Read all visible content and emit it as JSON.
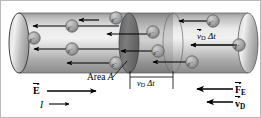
{
  "figure": {
    "type": "physics-diagram",
    "background": "#ffffff",
    "border_color": "#b9b9b9"
  },
  "labels": {
    "area": {
      "text": "Area ",
      "symbol": "A"
    },
    "slab_width": {
      "v": "v",
      "sub": "D",
      "dt": " Δt"
    },
    "drift_distance": {
      "v": "v",
      "sub": "D",
      "dt": " Δt"
    },
    "field": {
      "symbol": "E"
    },
    "current": {
      "symbol": "I"
    },
    "force": {
      "symbol": "F",
      "sub": "E"
    },
    "drift_velocity": {
      "symbol": "v",
      "sub": "D"
    },
    "electron": {
      "symbol": "e",
      "charge": "−"
    }
  },
  "colors": {
    "cylinder_light": "#e8e8e8",
    "cylinder_mid": "#b5b5b5",
    "cylinder_dark": "#8a8a8a",
    "disk_dark": "#6f6f6f",
    "slab_shade": "#9a9a9a",
    "outline": "#2a2a2a",
    "arrow": "#000000",
    "electron_fill": "#a8a8a8",
    "electron_stroke": "#555555",
    "text": "#000000"
  },
  "geometry": {
    "cylinder": {
      "left_x": 18,
      "right_x": 247,
      "top_y": 12,
      "bottom_y": 72,
      "cap_rx": 10
    },
    "disk_area_a": {
      "cx": 128,
      "rx": 10
    },
    "slab_right": {
      "cx": 172,
      "rx": 10
    }
  },
  "electrons": [
    {
      "cx": 71,
      "cy": 25
    },
    {
      "cx": 115,
      "cy": 17
    },
    {
      "cx": 71,
      "cy": 48
    },
    {
      "cx": 115,
      "cy": 62
    },
    {
      "cx": 33,
      "cy": 37
    },
    {
      "cx": 152,
      "cy": 31
    },
    {
      "cx": 157,
      "cy": 50
    },
    {
      "cx": 212,
      "cy": 20
    },
    {
      "cx": 238,
      "cy": 44
    },
    {
      "cx": 191,
      "cy": 61
    }
  ],
  "arrows": [
    {
      "from_x": 118,
      "to_x": 32,
      "y": 25
    },
    {
      "from_x": 98,
      "to_x": 78,
      "y": 19
    },
    {
      "from_x": 118,
      "to_x": 33,
      "y": 48
    },
    {
      "from_x": 108,
      "to_x": 66,
      "y": 62
    },
    {
      "from_x": 150,
      "to_x": 106,
      "y": 33
    },
    {
      "from_x": 155,
      "to_x": 120,
      "y": 50
    },
    {
      "from_x": 210,
      "to_x": 178,
      "y": 20
    },
    {
      "from_x": 236,
      "to_x": 190,
      "y": 44
    },
    {
      "from_x": 188,
      "to_x": 152,
      "y": 61
    },
    {
      "from_x": 62,
      "to_x": 112,
      "y": 90,
      "dir": "right"
    },
    {
      "from_x": 47,
      "to_x": 66,
      "y": 103,
      "dir": "right"
    },
    {
      "from_x": 232,
      "to_x": 196,
      "y": 88
    },
    {
      "from_x": 232,
      "to_x": 206,
      "y": 101
    }
  ]
}
